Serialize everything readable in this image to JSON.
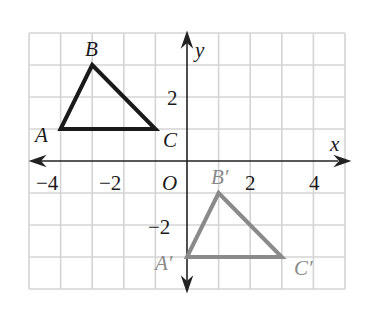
{
  "figure": {
    "type": "coordinate-plane-translation",
    "axes": {
      "x_label": "x",
      "y_label": "y",
      "origin_label": "O",
      "x_range": [
        -5,
        5
      ],
      "y_range": [
        -4,
        4
      ],
      "x_tick_labels": [
        {
          "value": -4,
          "text": "−4"
        },
        {
          "value": -2,
          "text": "−2"
        },
        {
          "value": 2,
          "text": "2"
        },
        {
          "value": 4,
          "text": "4"
        }
      ],
      "y_tick_labels": [
        {
          "value": 2,
          "text": "2"
        },
        {
          "value": -2,
          "text": "−2"
        }
      ]
    },
    "preimage": {
      "name": "triangle ABC",
      "color": "#1a1a1a",
      "vertices": [
        {
          "label": "A",
          "x": -4,
          "y": 1
        },
        {
          "label": "B",
          "x": -3,
          "y": 3
        },
        {
          "label": "C",
          "x": -1,
          "y": 1
        }
      ]
    },
    "image": {
      "name": "triangle A'B'C'",
      "color": "#8a8a8a",
      "vertices": [
        {
          "label": "A′",
          "x": 0,
          "y": -3
        },
        {
          "label": "B′",
          "x": 1,
          "y": -1
        },
        {
          "label": "C′",
          "x": 3,
          "y": -3
        }
      ]
    },
    "grid_color": "#d4d4d4",
    "axis_color": "#222222"
  }
}
